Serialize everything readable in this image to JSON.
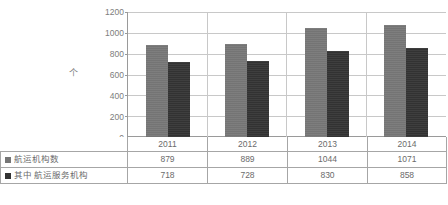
{
  "chart_data": {
    "type": "bar",
    "title": "",
    "xlabel": "",
    "ylabel": "个",
    "ylim": [
      0,
      1200
    ],
    "ytick_step": 200,
    "yticks": [
      "1200",
      "1000",
      "800",
      "600",
      "400",
      "200",
      "0"
    ],
    "grid": true,
    "legend_position": "table-row-headers",
    "categories": [
      "2011",
      "2012",
      "2013",
      "2014"
    ],
    "series": [
      {
        "name": "航运机构数",
        "color": "#767676",
        "values": [
          879,
          889,
          1044,
          1071
        ],
        "value_labels": [
          "879",
          "889",
          "1044",
          "1071"
        ]
      },
      {
        "name": "其中  航运服务机构",
        "color": "#333333",
        "values": [
          718,
          728,
          830,
          858
        ],
        "value_labels": [
          "718",
          "728",
          "830",
          "858"
        ]
      }
    ]
  },
  "colors": {
    "series1": "#767676",
    "series2": "#333333",
    "gridline": "#c8c8c8",
    "axis": "#9a9a9a",
    "table_border": "#a6a6a6",
    "text": "#6b6b6b"
  },
  "icons": {
    "legend_swatch_1": "legend-swatch-square",
    "legend_swatch_2": "legend-swatch-square"
  }
}
